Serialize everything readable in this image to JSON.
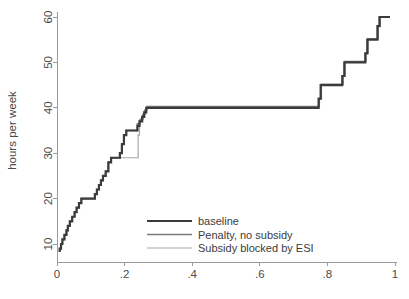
{
  "chart_data": {
    "type": "line",
    "title": "",
    "subtitle": "",
    "xlabel": "",
    "ylabel": "hours per week",
    "xlim": [
      0,
      1
    ],
    "ylim": [
      6,
      62
    ],
    "grid": false,
    "legend_position": "bottom-center",
    "x_ticks": [
      {
        "value": 0,
        "label": "0"
      },
      {
        "value": 0.2,
        "label": ".2"
      },
      {
        "value": 0.4,
        "label": ".4"
      },
      {
        "value": 0.6,
        "label": ".6"
      },
      {
        "value": 0.8,
        "label": ".8"
      },
      {
        "value": 1,
        "label": "1"
      }
    ],
    "y_ticks": [
      {
        "value": 10,
        "label": "10"
      },
      {
        "value": 20,
        "label": "20"
      },
      {
        "value": 30,
        "label": "30"
      },
      {
        "value": 40,
        "label": "40"
      },
      {
        "value": 50,
        "label": "50"
      },
      {
        "value": 60,
        "label": "60"
      }
    ],
    "series": [
      {
        "name": "baseline",
        "color": "#3b3b3b",
        "width": 2.2,
        "step": true,
        "points": [
          [
            0.005,
            8.5
          ],
          [
            0.008,
            9.0
          ],
          [
            0.012,
            10.0
          ],
          [
            0.016,
            11.0
          ],
          [
            0.022,
            12.0
          ],
          [
            0.028,
            13.0
          ],
          [
            0.032,
            14.0
          ],
          [
            0.038,
            15.0
          ],
          [
            0.045,
            16.0
          ],
          [
            0.052,
            17.0
          ],
          [
            0.058,
            18.0
          ],
          [
            0.065,
            19.0
          ],
          [
            0.072,
            20.0
          ],
          [
            0.105,
            20.0
          ],
          [
            0.112,
            21.0
          ],
          [
            0.118,
            22.0
          ],
          [
            0.124,
            23.0
          ],
          [
            0.13,
            24.0
          ],
          [
            0.136,
            25.0
          ],
          [
            0.144,
            26.0
          ],
          [
            0.152,
            28.0
          ],
          [
            0.16,
            29.0
          ],
          [
            0.178,
            29.0
          ],
          [
            0.186,
            30.0
          ],
          [
            0.192,
            32.0
          ],
          [
            0.198,
            34.0
          ],
          [
            0.205,
            35.0
          ],
          [
            0.232,
            35.0
          ],
          [
            0.238,
            36.0
          ],
          [
            0.244,
            37.0
          ],
          [
            0.252,
            38.0
          ],
          [
            0.258,
            39.0
          ],
          [
            0.264,
            40.0
          ],
          [
            0.768,
            40.0
          ],
          [
            0.774,
            42.0
          ],
          [
            0.78,
            45.0
          ],
          [
            0.838,
            45.0
          ],
          [
            0.844,
            47.0
          ],
          [
            0.85,
            50.0
          ],
          [
            0.905,
            50.0
          ],
          [
            0.912,
            52.0
          ],
          [
            0.918,
            55.0
          ],
          [
            0.942,
            55.0
          ],
          [
            0.948,
            58.0
          ],
          [
            0.954,
            60.0
          ],
          [
            0.985,
            60.0
          ]
        ]
      },
      {
        "name": "Penalty, no subsidy",
        "color": "#7b7b7b",
        "width": 1.5,
        "step": true,
        "points": [
          [
            0.005,
            8.5
          ],
          [
            0.008,
            9.0
          ],
          [
            0.012,
            10.0
          ],
          [
            0.016,
            11.0
          ],
          [
            0.022,
            12.0
          ],
          [
            0.028,
            13.0
          ],
          [
            0.032,
            14.0
          ],
          [
            0.038,
            15.0
          ],
          [
            0.045,
            16.0
          ],
          [
            0.052,
            17.0
          ],
          [
            0.058,
            18.0
          ],
          [
            0.065,
            19.0
          ],
          [
            0.072,
            20.0
          ],
          [
            0.105,
            20.0
          ],
          [
            0.112,
            21.0
          ],
          [
            0.118,
            22.0
          ],
          [
            0.124,
            23.0
          ],
          [
            0.13,
            24.0
          ],
          [
            0.136,
            25.0
          ],
          [
            0.144,
            26.0
          ],
          [
            0.152,
            28.0
          ],
          [
            0.16,
            29.0
          ],
          [
            0.178,
            29.0
          ],
          [
            0.186,
            30.0
          ],
          [
            0.192,
            32.0
          ],
          [
            0.198,
            34.0
          ],
          [
            0.205,
            35.0
          ],
          [
            0.232,
            35.0
          ],
          [
            0.238,
            36.5
          ],
          [
            0.246,
            37.5
          ],
          [
            0.254,
            38.5
          ],
          [
            0.26,
            39.5
          ],
          [
            0.266,
            40.3
          ],
          [
            0.77,
            40.3
          ],
          [
            0.776,
            42.0
          ],
          [
            0.782,
            45.2
          ],
          [
            0.84,
            45.2
          ],
          [
            0.846,
            47.0
          ],
          [
            0.852,
            50.2
          ],
          [
            0.907,
            50.2
          ],
          [
            0.914,
            52.0
          ],
          [
            0.92,
            55.2
          ],
          [
            0.944,
            55.2
          ],
          [
            0.95,
            58.0
          ],
          [
            0.956,
            60.0
          ],
          [
            0.985,
            60.0
          ]
        ]
      },
      {
        "name": "Subsidy blocked by ESI",
        "color": "#a8a8a8",
        "width": 1.2,
        "step": true,
        "points": [
          [
            0.005,
            8.5
          ],
          [
            0.008,
            9.0
          ],
          [
            0.012,
            10.0
          ],
          [
            0.016,
            11.0
          ],
          [
            0.022,
            12.0
          ],
          [
            0.028,
            13.0
          ],
          [
            0.032,
            14.0
          ],
          [
            0.038,
            15.0
          ],
          [
            0.045,
            16.0
          ],
          [
            0.052,
            17.0
          ],
          [
            0.058,
            18.0
          ],
          [
            0.065,
            19.0
          ],
          [
            0.072,
            20.0
          ],
          [
            0.105,
            20.0
          ],
          [
            0.112,
            21.0
          ],
          [
            0.118,
            22.0
          ],
          [
            0.124,
            23.0
          ],
          [
            0.13,
            24.0
          ],
          [
            0.136,
            25.0
          ],
          [
            0.144,
            26.0
          ],
          [
            0.152,
            28.0
          ],
          [
            0.16,
            29.0
          ],
          [
            0.236,
            29.0
          ],
          [
            0.24,
            34.0
          ],
          [
            0.244,
            37.0
          ],
          [
            0.252,
            38.2
          ],
          [
            0.258,
            39.2
          ],
          [
            0.264,
            40.1
          ],
          [
            0.769,
            40.1
          ],
          [
            0.775,
            42.0
          ],
          [
            0.781,
            45.1
          ],
          [
            0.839,
            45.1
          ],
          [
            0.845,
            47.0
          ],
          [
            0.851,
            50.1
          ],
          [
            0.906,
            50.1
          ],
          [
            0.913,
            52.0
          ],
          [
            0.919,
            55.1
          ],
          [
            0.943,
            55.1
          ],
          [
            0.949,
            58.0
          ],
          [
            0.955,
            60.0
          ],
          [
            0.985,
            60.0
          ]
        ]
      }
    ],
    "annotations": []
  },
  "legend": {
    "entries": [
      {
        "label": "baseline"
      },
      {
        "label": "Penalty, no subsidy"
      },
      {
        "label": "Subsidy blocked by ESI"
      }
    ]
  },
  "axis": {
    "y_title": "hours per week"
  }
}
